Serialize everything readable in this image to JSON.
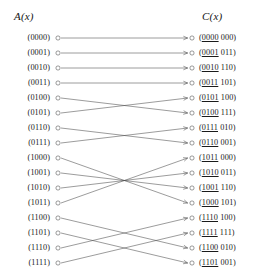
{
  "figure": {
    "headers": {
      "left": "A(x)",
      "right": "C(x)"
    },
    "left_nodes": [
      {
        "label": "(0000)"
      },
      {
        "label": "(0001)"
      },
      {
        "label": "(0010)"
      },
      {
        "label": "(0011)"
      },
      {
        "label": "(0100)"
      },
      {
        "label": "(0101)"
      },
      {
        "label": "(0110)"
      },
      {
        "label": "(0111)"
      },
      {
        "label": "(1000)"
      },
      {
        "label": "(1001)"
      },
      {
        "label": "(1010)"
      },
      {
        "label": "(1011)"
      },
      {
        "label": "(1100)"
      },
      {
        "label": "(1101)"
      },
      {
        "label": "(1110)"
      },
      {
        "label": "(1111)"
      }
    ],
    "right_nodes": [
      {
        "open": "(",
        "prefix": "0000",
        "suffix": " 000",
        "close": ")"
      },
      {
        "open": "(",
        "prefix": "0001",
        "suffix": " 011",
        "close": ")"
      },
      {
        "open": "(",
        "prefix": "0010",
        "suffix": " 110",
        "close": ")"
      },
      {
        "open": "(",
        "prefix": "0011",
        "suffix": " 101",
        "close": ")"
      },
      {
        "open": "(",
        "prefix": "0101",
        "suffix": " 100",
        "close": ")"
      },
      {
        "open": "(",
        "prefix": "0100",
        "suffix": " 111",
        "close": ")"
      },
      {
        "open": "(",
        "prefix": "0111",
        "suffix": " 010",
        "close": ")"
      },
      {
        "open": "(",
        "prefix": "0110",
        "suffix": " 001",
        "close": ")"
      },
      {
        "open": "(",
        "prefix": "1011",
        "suffix": " 000",
        "close": ")"
      },
      {
        "open": "(",
        "prefix": "1010",
        "suffix": " 011",
        "close": ")"
      },
      {
        "open": "(",
        "prefix": "1001",
        "suffix": " 110",
        "close": ")"
      },
      {
        "open": "(",
        "prefix": "1000",
        "suffix": " 101",
        "close": ")"
      },
      {
        "open": "(",
        "prefix": "1110",
        "suffix": " 100",
        "close": ")"
      },
      {
        "open": "(",
        "prefix": "1111",
        "suffix": " 111",
        "close": ")"
      },
      {
        "open": "(",
        "prefix": "1100",
        "suffix": " 010",
        "close": ")"
      },
      {
        "open": "(",
        "prefix": "1101",
        "suffix": " 001",
        "close": ")"
      }
    ],
    "edges": [
      {
        "from": 0,
        "to": 0
      },
      {
        "from": 1,
        "to": 1
      },
      {
        "from": 2,
        "to": 2
      },
      {
        "from": 3,
        "to": 3
      },
      {
        "from": 4,
        "to": 5
      },
      {
        "from": 5,
        "to": 4
      },
      {
        "from": 6,
        "to": 7
      },
      {
        "from": 7,
        "to": 6
      },
      {
        "from": 8,
        "to": 11
      },
      {
        "from": 9,
        "to": 10
      },
      {
        "from": 10,
        "to": 9
      },
      {
        "from": 11,
        "to": 8
      },
      {
        "from": 12,
        "to": 14
      },
      {
        "from": 13,
        "to": 15
      },
      {
        "from": 14,
        "to": 12
      },
      {
        "from": 15,
        "to": 13
      }
    ],
    "geometry": {
      "left_node_x": 58,
      "right_node_x": 192,
      "first_row_y": 38,
      "row_spacing": 15,
      "node_radius": 2.1
    },
    "colors": {
      "line": "#4a4a4a",
      "text": "#1a1a1a",
      "background": "#ffffff"
    }
  }
}
